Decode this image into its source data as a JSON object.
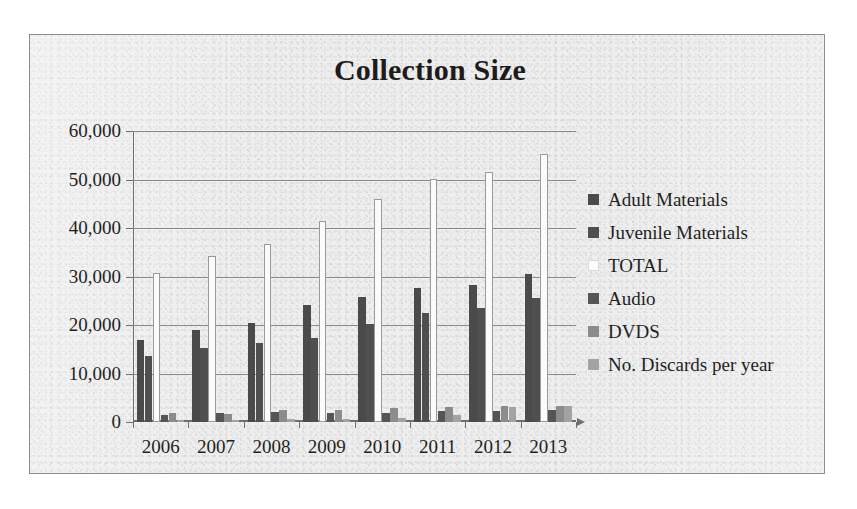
{
  "chart_data": {
    "type": "bar",
    "title": "Collection Size",
    "xlabel": "",
    "ylabel": "",
    "grid": true,
    "legend_position": "right",
    "ylim": [
      0,
      60000
    ],
    "yticks": [
      0,
      10000,
      20000,
      30000,
      40000,
      50000,
      60000
    ],
    "ytick_labels": [
      "0",
      "10,000",
      "20,000",
      "30,000",
      "40,000",
      "50,000",
      "60,000"
    ],
    "categories": [
      "2006",
      "2007",
      "2008",
      "2009",
      "2010",
      "2011",
      "2012",
      "2013"
    ],
    "series": [
      {
        "name": "Adult Materials",
        "color": "#4a4a4a",
        "values": [
          17000,
          19000,
          20500,
          24200,
          25800,
          27700,
          28300,
          30500
        ]
      },
      {
        "name": "Juvenile Materials",
        "color": "#4f4f4f",
        "values": [
          13700,
          15300,
          16300,
          17300,
          20200,
          22500,
          23500,
          25600
        ]
      },
      {
        "name": "TOTAL",
        "color": "#ffffff",
        "values": [
          30700,
          34300,
          36800,
          41500,
          46000,
          50100,
          51500,
          55300
        ]
      },
      {
        "name": "Audio",
        "color": "#555555",
        "values": [
          1500,
          1900,
          2100,
          1800,
          1900,
          2200,
          2200,
          2400
        ]
      },
      {
        "name": "DVDS",
        "color": "#8c8c8c",
        "values": [
          1800,
          1700,
          2400,
          2500,
          2800,
          3100,
          3300,
          3400
        ]
      },
      {
        "name": "No. Discards per year",
        "color": "#a3a3a3",
        "values": [
          400,
          350,
          600,
          700,
          900,
          1400,
          3100,
          3300
        ]
      }
    ]
  },
  "legend": {
    "items": [
      {
        "label": "Adult Materials"
      },
      {
        "label": "Juvenile Materials"
      },
      {
        "label": "TOTAL"
      },
      {
        "label": "Audio"
      },
      {
        "label": "DVDS"
      },
      {
        "label": "No. Discards per year"
      }
    ]
  }
}
